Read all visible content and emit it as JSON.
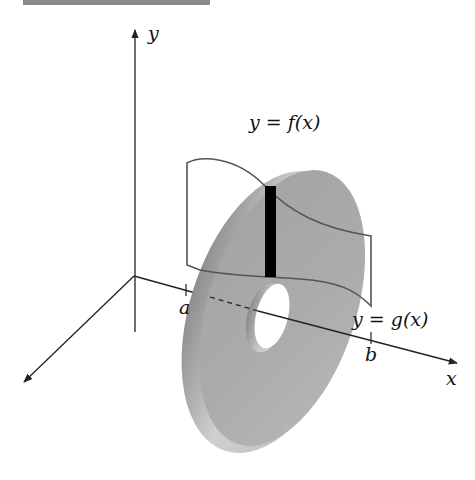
{
  "header": {
    "bar_color": "#8a8a8a"
  },
  "figure": {
    "labels": {
      "y_axis": "y",
      "x_axis": "x",
      "a": "a",
      "b": "b",
      "upper_curve": "y = f(x)",
      "lower_curve": "y = g(x)"
    },
    "colors": {
      "axis": "#222222",
      "curve": "#555555",
      "washer_face": "#a9a9a9",
      "washer_rim": "#cfcfcf",
      "washer_rim_dark": "#8e8e8e",
      "strip": "#000000",
      "background": "#ffffff"
    }
  }
}
